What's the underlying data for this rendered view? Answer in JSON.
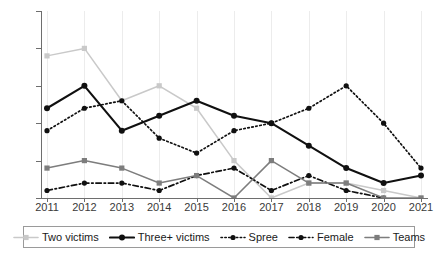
{
  "chart_data": {
    "type": "line",
    "title": "",
    "subtitle": "",
    "xlabel": "",
    "ylabel": "",
    "categories": [
      "2011",
      "2012",
      "2013",
      "2014",
      "2015",
      "2016",
      "2017",
      "2018",
      "2019",
      "2020",
      "2021"
    ],
    "x": [
      2011,
      2012,
      2013,
      2014,
      2015,
      2016,
      2017,
      2018,
      2019,
      2020,
      2021
    ],
    "ylim": [
      0,
      25
    ],
    "yticks": [
      0,
      5,
      10,
      15,
      20,
      25
    ],
    "xticks": [
      "2011",
      "2012",
      "2013",
      "2014",
      "2015",
      "2016",
      "2017",
      "2018",
      "2019",
      "2020",
      "2021"
    ],
    "grid": "vertical",
    "legend_position": "bottom",
    "series": [
      {
        "name": "Two victims",
        "color": "#c9c9c9",
        "line_style": "solid",
        "marker": "square",
        "values": [
          19,
          20,
          13,
          15,
          12,
          5,
          0,
          2,
          2,
          1,
          0
        ]
      },
      {
        "name": "Three+ victims",
        "color": "#101010",
        "line_style": "solid",
        "marker": "circle",
        "values": [
          12,
          15,
          9,
          11,
          13,
          11,
          10,
          7,
          4,
          2,
          3
        ]
      },
      {
        "name": "Spree",
        "color": "#101010",
        "line_style": "dotted",
        "marker": "circle",
        "values": [
          9,
          12,
          13,
          8,
          6,
          9,
          10,
          12,
          15,
          10,
          4
        ]
      },
      {
        "name": "Female",
        "color": "#101010",
        "line_style": "dashdot",
        "marker": "circle",
        "values": [
          1,
          2,
          2,
          1,
          3,
          4,
          1,
          3,
          1,
          0,
          null
        ]
      },
      {
        "name": "Teams",
        "color": "#7d7d7d",
        "line_style": "solid",
        "marker": "square",
        "values": [
          4,
          5,
          4,
          2,
          3,
          0,
          5,
          2,
          2,
          0,
          0
        ]
      }
    ]
  },
  "axis": {
    "ytick_labels": [
      "0",
      "5",
      "10",
      "15",
      "20",
      "25"
    ],
    "xtick_labels": [
      "2011",
      "2012",
      "2013",
      "2014",
      "2015",
      "2016",
      "2017",
      "2018",
      "2019",
      "2020",
      "2021"
    ]
  },
  "legend": {
    "items": [
      {
        "label": "Two victims"
      },
      {
        "label": "Three+ victims"
      },
      {
        "label": "Spree"
      },
      {
        "label": "Female"
      },
      {
        "label": "Teams"
      }
    ]
  },
  "colors": {
    "axis": "#6e6e6e",
    "grid": "#ececec",
    "text": "#3a3a3a",
    "two_victims": "#c9c9c9",
    "three_plus_victims": "#101010",
    "spree": "#101010",
    "female": "#101010",
    "teams": "#7d7d7d"
  }
}
